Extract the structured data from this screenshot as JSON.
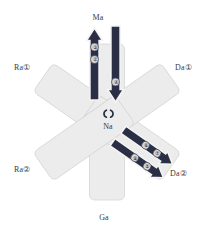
{
  "diagram": {
    "background_color": "#ffffff",
    "arm_fill": "#ececec",
    "arm_stroke": "#d2d2d2",
    "arrow_fill": "#2b2f45",
    "arrow_stroke": "#f2f2f2",
    "badge_fill": "#d9d9d9",
    "badge_text_color": "#2b2f45",
    "label_color": "#3a3a3a"
  },
  "labels": {
    "top": "Ma",
    "bottom": "Ga",
    "upper_left": "Ra①",
    "lower_left": "Ra②",
    "upper_right": "Da①",
    "lower_right": "Da②",
    "center": "Na"
  },
  "center_glyph": {
    "name": "paired-arcs-glyph",
    "text": "{}"
  },
  "arrows": [
    {
      "id": "top-arm-up-arrow",
      "arm": "Ma",
      "direction": "up",
      "badges": [
        "③",
        "②"
      ]
    },
    {
      "id": "top-arm-down-arrow",
      "arm": "Ma",
      "direction": "down",
      "badges": [
        "④"
      ]
    },
    {
      "id": "lower-right-arm-outer-arrow",
      "arm": "Da②",
      "direction": "down-right",
      "badges": [
        "⑦",
        "⑥"
      ]
    },
    {
      "id": "lower-right-arm-inner-arrow",
      "arm": "Da②",
      "direction": "down-right",
      "badges": [
        "⑤",
        "⑧"
      ]
    }
  ]
}
